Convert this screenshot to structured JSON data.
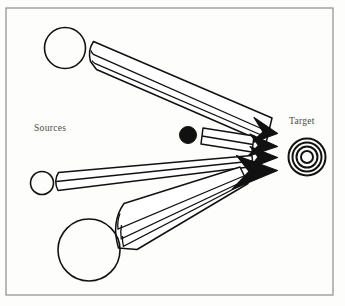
{
  "figure": {
    "kind": "schematic-diagram",
    "title_visible": false,
    "background_color": "#fdfdfc",
    "border": {
      "name": "figure-border",
      "color": "#8d8d8d",
      "stroke_width": 1.2,
      "x": 6,
      "y": 8,
      "width": 327,
      "height": 287
    },
    "labels": {
      "sources": "Sources",
      "target": "Target"
    },
    "label_color": "#4a4a4a",
    "ink_color": "#111111",
    "sources": [
      {
        "name": "source-circle-top",
        "shape": "circle-outline",
        "cx": 65,
        "cy": 48,
        "r": 20.5,
        "fill": "none",
        "stroke": "#111111"
      },
      {
        "name": "source-circle-middle",
        "shape": "circle-outline",
        "cx": 42,
        "cy": 183,
        "r": 11.5,
        "fill": "none",
        "stroke": "#111111"
      },
      {
        "name": "source-circle-bottom",
        "shape": "circle-outline",
        "cx": 89,
        "cy": 250,
        "r": 31,
        "fill": "none",
        "stroke": "#111111"
      },
      {
        "name": "source-dot-filled",
        "shape": "circle-filled",
        "cx": 188,
        "cy": 135,
        "r": 8.5,
        "fill": "#111111",
        "stroke": "#111111"
      }
    ],
    "target": {
      "name": "target-bullseye",
      "shape": "concentric-rings",
      "cx": 307,
      "cy": 157,
      "rings": [
        18.5,
        14.5,
        10.5,
        6.5
      ],
      "stroke": "#111111",
      "stroke_width": 2.0
    },
    "beams": [
      {
        "name": "beam-from-top-source",
        "fill": "none",
        "stroke": "#111111",
        "tail_x": 93,
        "tail_y": 55,
        "tip_x": 277,
        "tip_y": 133,
        "internal_lines": 2,
        "arrowhead": "outline"
      },
      {
        "name": "beam-from-dot-source",
        "fill": "none",
        "stroke": "#111111",
        "tail_x": 203,
        "tail_y": 130,
        "tip_x": 277,
        "tip_y": 146,
        "internal_lines": 1,
        "arrowhead": "outline"
      },
      {
        "name": "beam-from-middle-source",
        "fill": "none",
        "stroke": "#111111",
        "tail_x": 58,
        "tail_y": 179,
        "tip_x": 277,
        "tip_y": 157,
        "internal_lines": 1,
        "arrowhead": "outline"
      },
      {
        "name": "beam-from-bottom-source",
        "fill": "none",
        "stroke": "#111111",
        "tail_x": 122,
        "tail_y": 226,
        "tip_x": 277,
        "tip_y": 170,
        "internal_lines": 3,
        "arrowhead": "filled"
      }
    ],
    "label_positions": {
      "sources": {
        "x": 34,
        "y": 131
      },
      "target": {
        "x": 289,
        "y": 124
      }
    }
  }
}
